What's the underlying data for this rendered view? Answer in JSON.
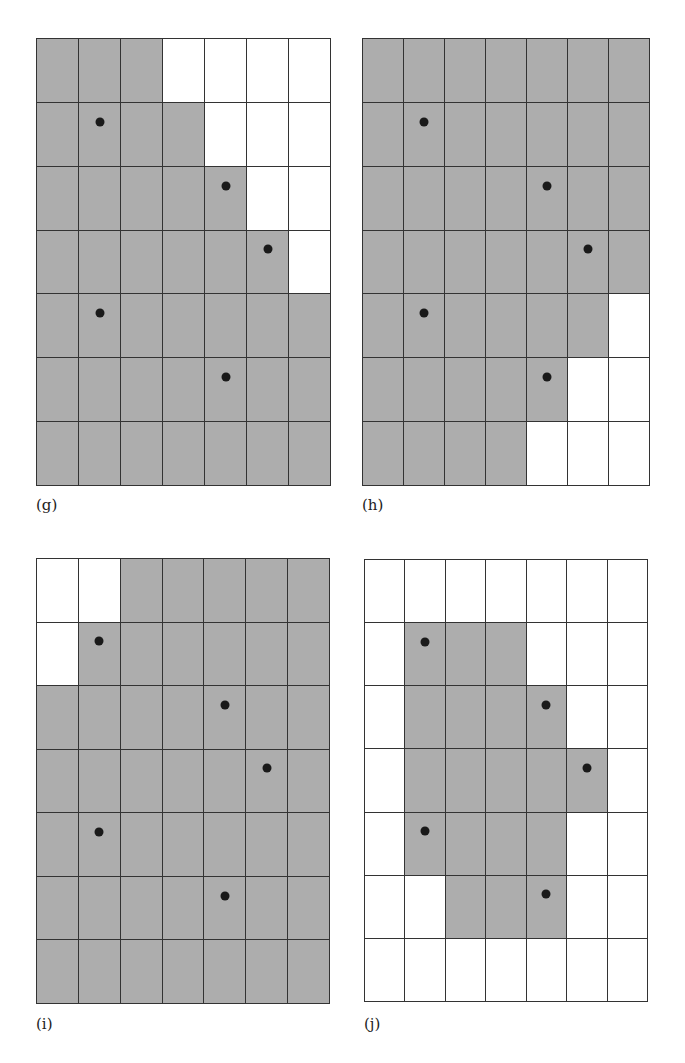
{
  "figure": {
    "rows": 7,
    "cols": 7,
    "colors": {
      "shaded": "#adadad",
      "empty": "#ffffff",
      "line": "#333333",
      "dot": "#1a1a1a"
    },
    "dots": [
      {
        "row": 1,
        "col": 1,
        "dx": 0.5
      },
      {
        "row": 2,
        "col": 4,
        "dx": 0.5
      },
      {
        "row": 3,
        "col": 5,
        "dx": 0.5
      },
      {
        "row": 4,
        "col": 1,
        "dx": 0.5
      },
      {
        "row": 5,
        "col": 4,
        "dx": 0.5
      }
    ],
    "panels": [
      {
        "id": "g",
        "label": "(g)",
        "left": 36,
        "top": 38,
        "width": 295,
        "height": 448,
        "label_left": 36,
        "label_top": 496,
        "shaded": [
          [
            1,
            1,
            1,
            0,
            0,
            0,
            0
          ],
          [
            1,
            1,
            1,
            1,
            0,
            0,
            0
          ],
          [
            1,
            1,
            1,
            1,
            1,
            0,
            0
          ],
          [
            1,
            1,
            1,
            1,
            1,
            1,
            0
          ],
          [
            1,
            1,
            1,
            1,
            1,
            1,
            1
          ],
          [
            1,
            1,
            1,
            1,
            1,
            1,
            1
          ],
          [
            1,
            1,
            1,
            1,
            1,
            1,
            1
          ]
        ]
      },
      {
        "id": "h",
        "label": "(h)",
        "left": 362,
        "top": 38,
        "width": 288,
        "height": 448,
        "label_left": 362,
        "label_top": 496,
        "shaded": [
          [
            1,
            1,
            1,
            1,
            1,
            1,
            1
          ],
          [
            1,
            1,
            1,
            1,
            1,
            1,
            1
          ],
          [
            1,
            1,
            1,
            1,
            1,
            1,
            1
          ],
          [
            1,
            1,
            1,
            1,
            1,
            1,
            1
          ],
          [
            1,
            1,
            1,
            1,
            1,
            1,
            0
          ],
          [
            1,
            1,
            1,
            1,
            1,
            0,
            0
          ],
          [
            1,
            1,
            1,
            1,
            0,
            0,
            0
          ]
        ]
      },
      {
        "id": "i",
        "label": "(i)",
        "left": 36,
        "top": 558,
        "width": 294,
        "height": 446,
        "label_left": 36,
        "label_top": 1015,
        "shaded": [
          [
            0,
            0,
            1,
            1,
            1,
            1,
            1
          ],
          [
            0,
            1,
            1,
            1,
            1,
            1,
            1
          ],
          [
            1,
            1,
            1,
            1,
            1,
            1,
            1
          ],
          [
            1,
            1,
            1,
            1,
            1,
            1,
            1
          ],
          [
            1,
            1,
            1,
            1,
            1,
            1,
            1
          ],
          [
            1,
            1,
            1,
            1,
            1,
            1,
            1
          ],
          [
            1,
            1,
            1,
            1,
            1,
            1,
            1
          ]
        ]
      },
      {
        "id": "j",
        "label": "(j)",
        "left": 364,
        "top": 559,
        "width": 284,
        "height": 443,
        "label_left": 364,
        "label_top": 1015,
        "shaded": [
          [
            0,
            0,
            0,
            0,
            0,
            0,
            0
          ],
          [
            0,
            1,
            1,
            1,
            0,
            0,
            0
          ],
          [
            0,
            1,
            1,
            1,
            1,
            0,
            0
          ],
          [
            0,
            1,
            1,
            1,
            1,
            1,
            0
          ],
          [
            0,
            1,
            1,
            1,
            1,
            0,
            0
          ],
          [
            0,
            0,
            1,
            1,
            1,
            0,
            0
          ],
          [
            0,
            0,
            0,
            0,
            0,
            0,
            0
          ]
        ]
      }
    ]
  }
}
